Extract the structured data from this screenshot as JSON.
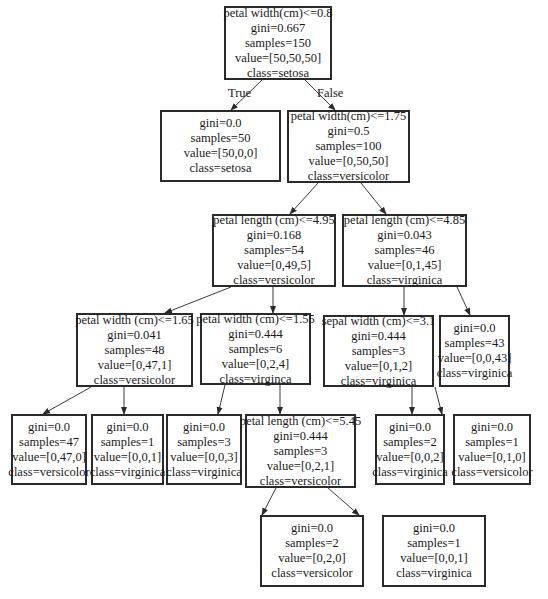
{
  "diagram": {
    "type": "decision-tree",
    "edge_labels": {
      "true": "True",
      "false": "False"
    },
    "nodes": {
      "n0": {
        "lines": [
          "petal width(cm)<=0.8",
          "gini=0.667",
          "samples=150",
          "value=[50,50,50]",
          "class=setosa"
        ]
      },
      "n1": {
        "lines": [
          "gini=0.0",
          "samples=50",
          "value=[50,0,0]",
          "class=setosa"
        ]
      },
      "n2": {
        "lines": [
          "petal width(cm)<=1.75",
          "gini=0.5",
          "samples=100",
          "value=[0,50,50]",
          "class=versicolor"
        ]
      },
      "n3": {
        "lines": [
          "petal length (cm)<=4.95",
          "gini=0.168",
          "samples=54",
          "value=[0,49,5]",
          "class=versicolor"
        ]
      },
      "n4": {
        "lines": [
          "petal length (cm)<=4.85",
          "gini=0.043",
          "samples=46",
          "value=[0,1,45]",
          "class=virginica"
        ]
      },
      "n5": {
        "lines": [
          "petal width (cm)<=1.65",
          "gini=0.041",
          "samples=48",
          "value=[0,47,1]",
          "class=versicolor"
        ]
      },
      "n6": {
        "lines": [
          "petal width (cm)<=1.55",
          "gini=0.444",
          "samples=6",
          "value=[0,2,4]",
          "class=virginca"
        ]
      },
      "n7": {
        "lines": [
          "sepal width (cm)<=3.1",
          "gini=0.444",
          "samples=3",
          "value=[0,1,2]",
          "class=virginica"
        ]
      },
      "n8": {
        "lines": [
          "gini=0.0",
          "samples=43",
          "value=[0,0,43]",
          "class=virginica"
        ]
      },
      "n9": {
        "lines": [
          "gini=0.0",
          "samples=47",
          "value=[0,47,0]",
          "class=versicolor"
        ]
      },
      "n10": {
        "lines": [
          "gini=0.0",
          "samples=1",
          "value=[0,0,1]",
          "class=virginica"
        ]
      },
      "n11": {
        "lines": [
          "gini=0.0",
          "samples=3",
          "value=[0,0,3]",
          "class=virginica"
        ]
      },
      "n12": {
        "lines": [
          "petal length (cm)<=5.45",
          "gini=0.444",
          "samples=3",
          "value=[0,2,1]",
          "class=versicolor"
        ]
      },
      "n13": {
        "lines": [
          "gini=0.0",
          "samples=2",
          "value=[0,0,2]",
          "class=virginica"
        ]
      },
      "n14": {
        "lines": [
          "gini=0.0",
          "samples=1",
          "value=[0,1,0]",
          "class=versicolor"
        ]
      },
      "n15": {
        "lines": [
          "gini=0.0",
          "samples=2",
          "value=[0,2,0]",
          "class=versicolor"
        ]
      },
      "n16": {
        "lines": [
          "gini=0.0",
          "samples=1",
          "value=[0,0,1]",
          "class=virginica"
        ]
      }
    },
    "edges": [
      [
        "n0",
        "n1"
      ],
      [
        "n0",
        "n2"
      ],
      [
        "n2",
        "n3"
      ],
      [
        "n2",
        "n4"
      ],
      [
        "n3",
        "n5"
      ],
      [
        "n3",
        "n6"
      ],
      [
        "n4",
        "n7"
      ],
      [
        "n4",
        "n8"
      ],
      [
        "n5",
        "n9"
      ],
      [
        "n5",
        "n10"
      ],
      [
        "n6",
        "n11"
      ],
      [
        "n6",
        "n12"
      ],
      [
        "n7",
        "n13"
      ],
      [
        "n7",
        "n14"
      ],
      [
        "n12",
        "n15"
      ],
      [
        "n12",
        "n16"
      ]
    ]
  }
}
